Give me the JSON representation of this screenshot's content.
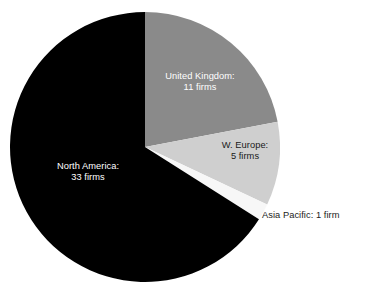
{
  "chart_data": {
    "type": "pie",
    "title": "",
    "subtitle": "",
    "unit": "firms",
    "total": 50,
    "legend": "none",
    "grid": false,
    "categories": [
      "North America",
      "United Kingdom",
      "W. Europe",
      "Asia Pacific"
    ],
    "values": [
      33,
      11,
      5,
      1
    ],
    "labels": [
      "North America: 33 firms",
      "United Kingdom: 11 firms",
      "W. Europe: 5 firms",
      "Asia Pacific: 1 firm"
    ],
    "slices": [
      {
        "name": "United Kingdom",
        "value": 11,
        "value_text": "11 firms",
        "label_line1": "United Kingdom:",
        "label_line2": "11 firms",
        "percent": 22,
        "start_angle": 0,
        "end_angle": 79.2,
        "color": "#8a8a8a",
        "label_color": "#ffffff",
        "label_placement": "inside"
      },
      {
        "name": "W. Europe",
        "value": 5,
        "value_text": "5 firms",
        "label_line1": "W. Europe:",
        "label_line2": "5 firms",
        "percent": 10,
        "start_angle": 79.2,
        "end_angle": 115.2,
        "color": "#cfcfcf",
        "label_color": "#1a1a1a",
        "label_placement": "inside"
      },
      {
        "name": "Asia Pacific",
        "value": 1,
        "value_text": "1 firm",
        "label_line1": "Asia Pacific: 1 firm",
        "label_line2": "",
        "percent": 2,
        "start_angle": 115.2,
        "end_angle": 122.4,
        "color": "#f7f7f7",
        "label_color": "#1a1a1a",
        "label_placement": "outside"
      },
      {
        "name": "North America",
        "value": 33,
        "value_text": "33 firms",
        "label_line1": "North America:",
        "label_line2": "33 firms",
        "percent": 66,
        "start_angle": 122.4,
        "end_angle": 360,
        "color": "#000000",
        "label_color": "#ffffff",
        "label_placement": "inside"
      }
    ],
    "geometry": {
      "center_x": 145,
      "center_y": 147,
      "radius": 135
    },
    "background": "#ffffff"
  }
}
